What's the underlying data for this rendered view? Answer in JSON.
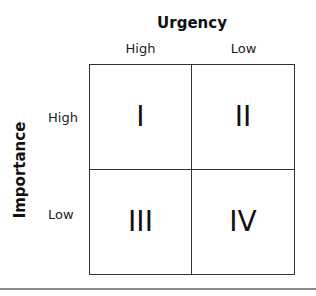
{
  "diagram": {
    "type": "2x2-matrix",
    "x_axis": {
      "title": "Urgency",
      "labels": [
        "High",
        "Low"
      ]
    },
    "y_axis": {
      "title": "Importance",
      "labels": [
        "High",
        "Low"
      ]
    },
    "quadrants": [
      {
        "position": "top-left",
        "label": "I"
      },
      {
        "position": "top-right",
        "label": "II"
      },
      {
        "position": "bottom-left",
        "label": "III"
      },
      {
        "position": "bottom-right",
        "label": "IV"
      }
    ],
    "colors": {
      "text": "#111111",
      "grid_line": "#333333",
      "bottom_rule": "#8a8a8a",
      "background": "#ffffff"
    }
  }
}
